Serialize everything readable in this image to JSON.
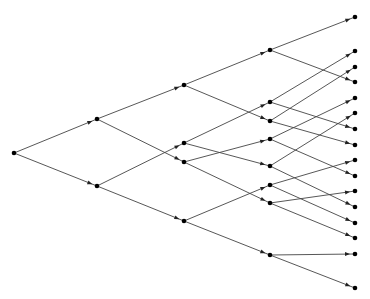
{
  "diagram": {
    "type": "binary-tree-lattice",
    "colors": {
      "edge": "#444444",
      "node": "#000000",
      "background": "#ffffff"
    },
    "nodes": [
      {
        "id": "n0",
        "x": 14,
        "y": 153
      },
      {
        "id": "a0",
        "x": 97,
        "y": 119
      },
      {
        "id": "a1",
        "x": 97,
        "y": 186
      },
      {
        "id": "b0",
        "x": 184,
        "y": 85
      },
      {
        "id": "b1",
        "x": 184,
        "y": 143
      },
      {
        "id": "b2",
        "x": 184,
        "y": 162
      },
      {
        "id": "b3",
        "x": 184,
        "y": 221
      },
      {
        "id": "c0",
        "x": 270,
        "y": 50
      },
      {
        "id": "c1",
        "x": 270,
        "y": 102
      },
      {
        "id": "c2",
        "x": 270,
        "y": 121
      },
      {
        "id": "c3",
        "x": 270,
        "y": 139
      },
      {
        "id": "c4",
        "x": 270,
        "y": 166
      },
      {
        "id": "c5",
        "x": 270,
        "y": 185
      },
      {
        "id": "c6",
        "x": 270,
        "y": 203
      },
      {
        "id": "c7",
        "x": 270,
        "y": 255
      },
      {
        "id": "d0",
        "x": 355,
        "y": 17
      },
      {
        "id": "d1",
        "x": 355,
        "y": 51
      },
      {
        "id": "d2",
        "x": 355,
        "y": 67
      },
      {
        "id": "d3",
        "x": 355,
        "y": 82
      },
      {
        "id": "d4",
        "x": 355,
        "y": 98
      },
      {
        "id": "d5",
        "x": 355,
        "y": 113
      },
      {
        "id": "d6",
        "x": 355,
        "y": 129
      },
      {
        "id": "d7",
        "x": 355,
        "y": 145
      },
      {
        "id": "d8",
        "x": 355,
        "y": 160
      },
      {
        "id": "d9",
        "x": 355,
        "y": 176
      },
      {
        "id": "d10",
        "x": 355,
        "y": 191
      },
      {
        "id": "d11",
        "x": 355,
        "y": 207
      },
      {
        "id": "d12",
        "x": 355,
        "y": 223
      },
      {
        "id": "d13",
        "x": 355,
        "y": 238
      },
      {
        "id": "d14",
        "x": 355,
        "y": 254
      },
      {
        "id": "d15",
        "x": 355,
        "y": 288
      }
    ],
    "edges": [
      [
        "n0",
        "a0"
      ],
      [
        "n0",
        "a1"
      ],
      [
        "a0",
        "b0"
      ],
      [
        "a0",
        "b2"
      ],
      [
        "a1",
        "b1"
      ],
      [
        "a1",
        "b3"
      ],
      [
        "b0",
        "c0"
      ],
      [
        "b0",
        "c2"
      ],
      [
        "b1",
        "c1"
      ],
      [
        "b1",
        "c4"
      ],
      [
        "b2",
        "c3"
      ],
      [
        "b2",
        "c6"
      ],
      [
        "b3",
        "c5"
      ],
      [
        "b3",
        "c7"
      ],
      [
        "c0",
        "d0"
      ],
      [
        "c0",
        "d3"
      ],
      [
        "c1",
        "d1"
      ],
      [
        "c1",
        "d6"
      ],
      [
        "c2",
        "d2"
      ],
      [
        "c2",
        "d7"
      ],
      [
        "c3",
        "d4"
      ],
      [
        "c3",
        "d9"
      ],
      [
        "c4",
        "d5"
      ],
      [
        "c4",
        "d11"
      ],
      [
        "c5",
        "d8"
      ],
      [
        "c5",
        "d12"
      ],
      [
        "c6",
        "d10"
      ],
      [
        "c6",
        "d13"
      ],
      [
        "c7",
        "d14"
      ],
      [
        "c7",
        "d15"
      ]
    ]
  }
}
